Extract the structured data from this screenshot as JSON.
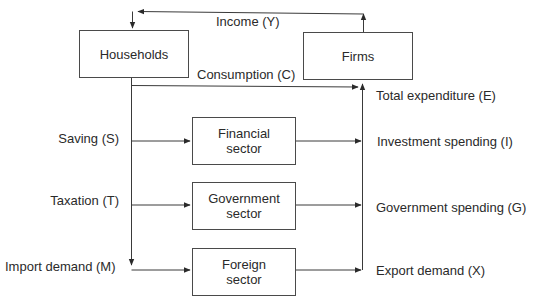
{
  "diagram": {
    "type": "circular-flow",
    "nodes": {
      "households": "Households",
      "firms": "Firms",
      "financial": [
        "Financial",
        "sector"
      ],
      "government": [
        "Government",
        "sector"
      ],
      "foreign": [
        "Foreign",
        "sector"
      ]
    },
    "flows": {
      "income": "Income (Y)",
      "consumption": "Consumption (C)",
      "total_expenditure": "Total expenditure (E)",
      "saving": "Saving (S)",
      "taxation": "Taxation (T)",
      "import_demand": "Import demand (M)",
      "investment": "Investment spending (I)",
      "government_spending": "Government spending (G)",
      "export_demand": "Export demand (X)"
    },
    "colors": {
      "line": "#3a3a3a",
      "text": "#2a2a2a",
      "background": "#ffffff"
    }
  }
}
